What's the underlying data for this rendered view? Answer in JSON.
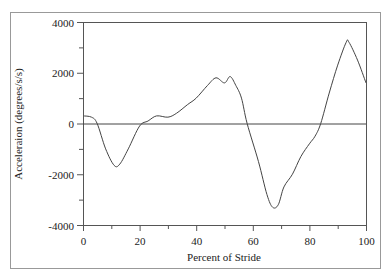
{
  "chart_data": {
    "type": "line",
    "title": "",
    "xlabel": "Percent of Stride",
    "ylabel": "Acceleraion (degrees/s/s)",
    "xlim": [
      0,
      100
    ],
    "ylim": [
      -4000,
      4000
    ],
    "xticks": [
      0,
      20,
      40,
      60,
      80,
      100
    ],
    "xticks_minor": [
      10,
      30,
      50,
      70,
      90
    ],
    "yticks": [
      4000,
      2000,
      0,
      -2000,
      -4000
    ],
    "yticks_minor": [
      3000,
      1000,
      -1000,
      -3000
    ],
    "xtick_labels": [
      "0",
      "20",
      "40",
      "60",
      "80",
      "100"
    ],
    "ytick_labels": [
      "4000",
      "2000",
      "0",
      "-2000",
      "-4000"
    ],
    "zero_line": true,
    "grid": false,
    "legend": "none",
    "series": [
      {
        "name": "Acceleration",
        "color": "#444444",
        "x": [
          0,
          3,
          5,
          8,
          11,
          13,
          16,
          20,
          23,
          26,
          30,
          33,
          37,
          40,
          44,
          47,
          50,
          52,
          54,
          56,
          58,
          62,
          65,
          67,
          69,
          71,
          74,
          77,
          80,
          82,
          84,
          87,
          90,
          93,
          94,
          97,
          100
        ],
        "y": [
          300,
          250,
          0,
          -1000,
          -1650,
          -1600,
          -1000,
          -100,
          100,
          300,
          250,
          400,
          750,
          1000,
          1500,
          1800,
          1600,
          1850,
          1500,
          1000,
          0,
          -1500,
          -2800,
          -3300,
          -3200,
          -2500,
          -2000,
          -1300,
          -800,
          -500,
          0,
          1200,
          2300,
          3200,
          3200,
          2500,
          1600
        ]
      }
    ]
  }
}
